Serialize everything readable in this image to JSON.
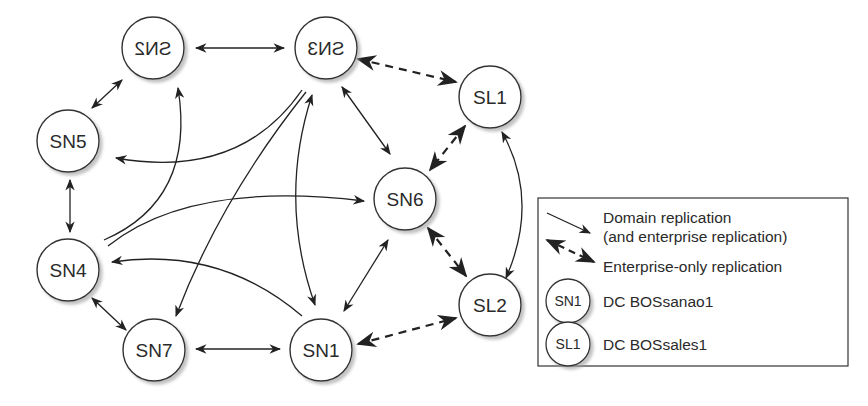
{
  "diagram": {
    "nodes": [
      {
        "id": "SN2",
        "label": "SN2",
        "mirrored": true
      },
      {
        "id": "SN3",
        "label": "SN3",
        "mirrored": true
      },
      {
        "id": "SL1",
        "label": "SL1"
      },
      {
        "id": "SN5",
        "label": "SN5"
      },
      {
        "id": "SN6",
        "label": "SN6"
      },
      {
        "id": "SN4",
        "label": "SN4"
      },
      {
        "id": "SL2",
        "label": "SL2"
      },
      {
        "id": "SN7",
        "label": "SN7"
      },
      {
        "id": "SN1",
        "label": "SN1"
      }
    ],
    "edges": {
      "domain": [
        [
          "SN2",
          "SN3"
        ],
        [
          "SN2",
          "SN5"
        ],
        [
          "SN5",
          "SN4"
        ],
        [
          "SN4",
          "SN7"
        ],
        [
          "SN7",
          "SN1"
        ],
        [
          "SN3",
          "SN6"
        ],
        [
          "SN6",
          "SN1"
        ],
        [
          "SN3",
          "SN1"
        ],
        [
          "SN3",
          "SN5"
        ],
        [
          "SN3",
          "SN7"
        ],
        [
          "SN4",
          "SN2"
        ],
        [
          "SN4",
          "SN6"
        ],
        [
          "SN1",
          "SN4"
        ],
        [
          "SL1",
          "SL2"
        ]
      ],
      "enterprise_only": [
        [
          "SN3",
          "SL1"
        ],
        [
          "SL1",
          "SN6"
        ],
        [
          "SN6",
          "SL2"
        ],
        [
          "SL2",
          "SN1"
        ]
      ]
    }
  },
  "legend": {
    "domain_line1": "Domain replication",
    "domain_line2": "(and enterprise replication)",
    "enterprise": "Enterprise-only replication",
    "sn_node_label": "SN1",
    "sn_desc": "DC BOSsanao1",
    "sl_node_label": "SL1",
    "sl_desc": "DC BOSsales1"
  }
}
